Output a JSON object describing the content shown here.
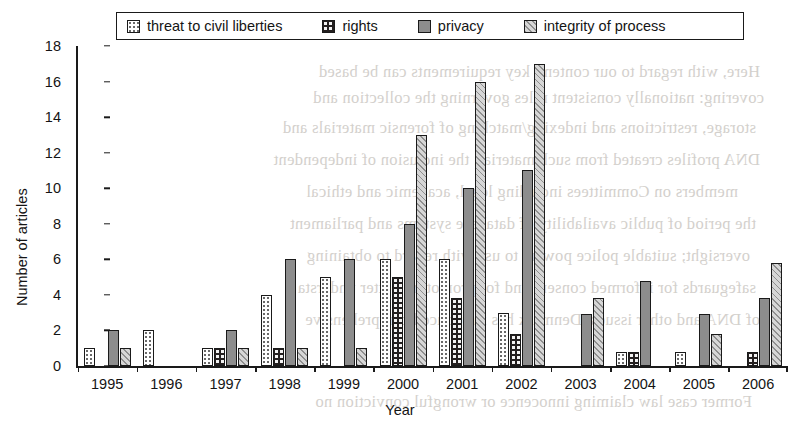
{
  "chart_data": {
    "type": "bar",
    "title": "",
    "xlabel": "Year",
    "ylabel": "Number of articles",
    "ylim": [
      0,
      18
    ],
    "ytick_step": 2,
    "yticks": [
      "0",
      "2",
      "4",
      "6",
      "8",
      "10",
      "12",
      "14",
      "16",
      "18"
    ],
    "grid": false,
    "legend_position": "top",
    "categories": [
      "1995",
      "1996",
      "1997",
      "1998",
      "1999",
      "2000",
      "2001",
      "2002",
      "2003",
      "2004",
      "2005",
      "2006"
    ],
    "series": [
      {
        "name": "threat to civil liberties",
        "pattern": "p-threat",
        "swatch_label": "white-dotted-swatch",
        "values": [
          1,
          2,
          1,
          4,
          5,
          6,
          6,
          3,
          0,
          0.8,
          0.8,
          0
        ]
      },
      {
        "name": "rights",
        "pattern": "p-rights",
        "swatch_label": "dark-dotted-swatch",
        "values": [
          0,
          0,
          1,
          1,
          0,
          5,
          3.8,
          1.8,
          0,
          0.8,
          0,
          0.8
        ]
      },
      {
        "name": "privacy",
        "pattern": "p-privacy",
        "swatch_label": "solid-gray-swatch",
        "values": [
          2,
          0,
          2,
          6,
          6,
          8,
          10,
          11,
          2.9,
          4.8,
          2.9,
          3.8
        ]
      },
      {
        "name": "integrity of process",
        "pattern": "p-integrity",
        "swatch_label": "diagonal-hatch-swatch",
        "values": [
          1,
          0,
          1,
          1,
          1,
          13,
          16,
          17,
          3.8,
          0,
          1.8,
          5.8
        ]
      }
    ]
  },
  "colors": {
    "axis": "#1a1a1a",
    "threat_fill": "#ffffff",
    "rights_fill": "#231f1f",
    "privacy_fill": "#8d8d8d",
    "integrity_fill": "#d6d6d6",
    "background": "#ffffff"
  },
  "bleed_text": [
    "Here, with regard to our content, key requirements can be based",
    "covering: nationally consistent rules governing the collection and",
    "storage, restrictions and indexing/matching of forensic materials and",
    "DNA profiles created from such material; the inclusion of independent",
    "members on Committees including legal, academic and ethical",
    "the period of public availability of database systems and parliament",
    "oversight; suitable police powers to use with regard to obtaining",
    "safeguards for informed consent and for promoting better understa",
    "of DNA and other issues. Denmark has introduced comprehensive",
    "Former case law claiming innocence or wrongful conviction no"
  ]
}
